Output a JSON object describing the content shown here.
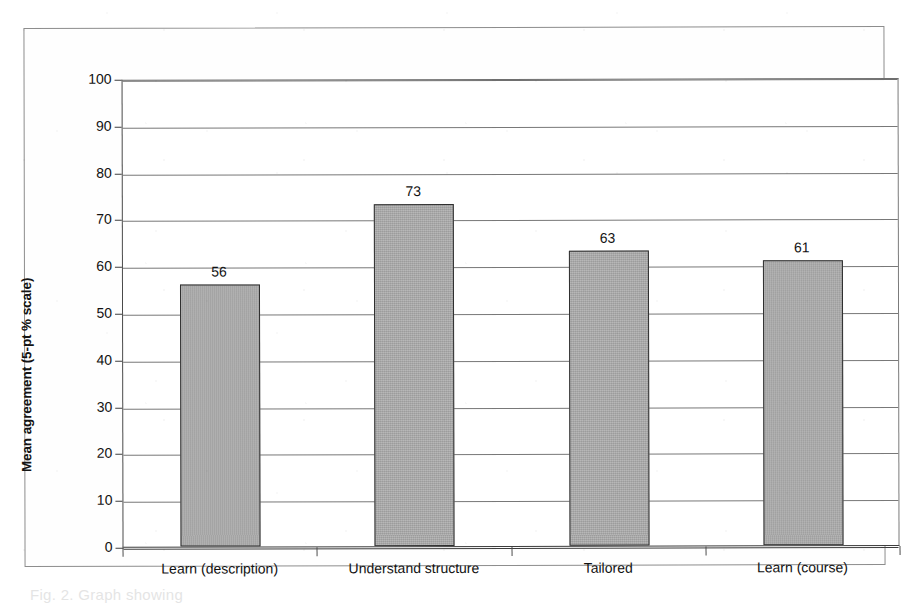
{
  "chart_data": {
    "type": "bar",
    "title": "",
    "xlabel": "",
    "ylabel": "Mean agreement (5-pt % scale)",
    "categories": [
      "Learn (description)",
      "Understand structure",
      "Tailored",
      "Learn (course)"
    ],
    "values": [
      56,
      73,
      63,
      61
    ],
    "data_labels": [
      "56",
      "73",
      "63",
      "61"
    ],
    "ylim": [
      0,
      100
    ],
    "ytick_step": 10,
    "yticks": [
      100,
      90,
      80,
      70,
      60,
      50,
      40,
      30,
      20,
      10,
      0
    ],
    "ytick_labels": [
      "100",
      "90",
      "80",
      "70",
      "60",
      "50",
      "40",
      "30",
      "20",
      "10",
      "0"
    ],
    "grid": true,
    "grid_axis": "y",
    "legend": false,
    "legend_position": "none",
    "bar_fill_color": "#a9a9a9",
    "bar_border_color": "#2f2f2f",
    "gridline_color": "#787878",
    "axis_color": "#3d3d3d",
    "text_color": "#121212"
  },
  "figure": {
    "frame_border_color": "#8d8d8d",
    "background_color": "#ffffff",
    "caption_remnant": "Fig. 2. Graph showing"
  }
}
